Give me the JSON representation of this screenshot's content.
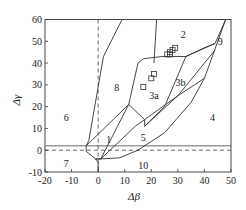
{
  "chart_data": {
    "type": "diagram",
    "title": "",
    "xlabel": "Δβ",
    "ylabel": "Δγ",
    "xlim": [
      -20,
      50
    ],
    "ylim": [
      -10,
      60
    ],
    "xticks": [
      -20,
      -10,
      0,
      10,
      20,
      30,
      40,
      50
    ],
    "yticks": [
      -10,
      0,
      10,
      20,
      30,
      40,
      50,
      60
    ],
    "grid": false,
    "reference_lines": {
      "dashed_horizontal_y": 0,
      "dashed_vertical_x": 0,
      "solid_horizontal_y": 2
    },
    "boundaries": [
      [
        [
          -3.5,
          4.5
        ],
        [
          2,
          43
        ],
        [
          9,
          60
        ]
      ],
      [
        [
          -4.5,
          2
        ],
        [
          11.5,
          21
        ],
        [
          17.5,
          14
        ]
      ],
      [
        [
          11.5,
          21
        ],
        [
          15,
          40
        ],
        [
          17,
          42
        ],
        [
          24,
          43
        ],
        [
          33,
          43
        ]
      ],
      [
        [
          22,
          60
        ],
        [
          21,
          40
        ]
      ],
      [
        [
          17.5,
          14
        ],
        [
          17.5,
          11
        ],
        [
          25,
          20
        ],
        [
          33,
          43
        ],
        [
          44,
          49
        ],
        [
          48,
          60
        ]
      ],
      [
        [
          17.5,
          11
        ],
        [
          30,
          25
        ],
        [
          44,
          46
        ]
      ],
      [
        [
          33,
          43
        ],
        [
          40,
          47
        ],
        [
          44,
          49
        ]
      ],
      [
        [
          -4.5,
          2
        ],
        [
          -4.5,
          -0.5
        ],
        [
          -1,
          -4
        ],
        [
          0,
          -5.5
        ],
        [
          0,
          -10
        ]
      ],
      [
        [
          -1,
          -4
        ],
        [
          1,
          -4
        ],
        [
          8,
          -3.5
        ],
        [
          15,
          0
        ],
        [
          25,
          8
        ],
        [
          35,
          22
        ],
        [
          40,
          33
        ],
        [
          48,
          60
        ]
      ],
      [
        [
          -1,
          -4
        ],
        [
          1,
          -4
        ],
        [
          14,
          11
        ],
        [
          30,
          25
        ],
        [
          40,
          33
        ]
      ],
      [
        [
          1,
          -4
        ],
        [
          11.5,
          21
        ]
      ],
      [
        [
          -3.5,
          4.5
        ],
        [
          -4.5,
          2
        ]
      ]
    ],
    "region_labels": [
      {
        "label": "1",
        "x": 4,
        "y": 5
      },
      {
        "label": "2",
        "x": 32,
        "y": 53
      },
      {
        "label": "3a",
        "x": 21,
        "y": 25
      },
      {
        "label": "3b",
        "x": 31,
        "y": 31
      },
      {
        "label": "4",
        "x": 43,
        "y": 15
      },
      {
        "label": "5",
        "x": 17,
        "y": 6
      },
      {
        "label": "6",
        "x": -12,
        "y": 15
      },
      {
        "label": "7",
        "x": -12,
        "y": -6
      },
      {
        "label": "8",
        "x": 7,
        "y": 29
      },
      {
        "label": "9",
        "x": 46,
        "y": 50
      },
      {
        "label": "10",
        "x": 17,
        "y": -7
      }
    ],
    "data_points": {
      "marker": "square-open",
      "points": [
        [
          17,
          29
        ],
        [
          20,
          33
        ],
        [
          21,
          35
        ],
        [
          26,
          44
        ],
        [
          27,
          44
        ],
        [
          27,
          45
        ],
        [
          28,
          46
        ],
        [
          29,
          47
        ]
      ]
    }
  }
}
